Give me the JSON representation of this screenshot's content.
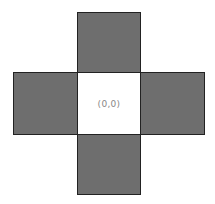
{
  "diagram": {
    "type": "cross of squares",
    "center": {
      "label": "(0,0)",
      "fill": "#ffffff"
    },
    "neighbors": [
      {
        "position": "top",
        "fill": "#6e6e6e"
      },
      {
        "position": "left",
        "fill": "#6e6e6e"
      },
      {
        "position": "right",
        "fill": "#6e6e6e"
      },
      {
        "position": "bottom",
        "fill": "#6e6e6e"
      }
    ]
  }
}
